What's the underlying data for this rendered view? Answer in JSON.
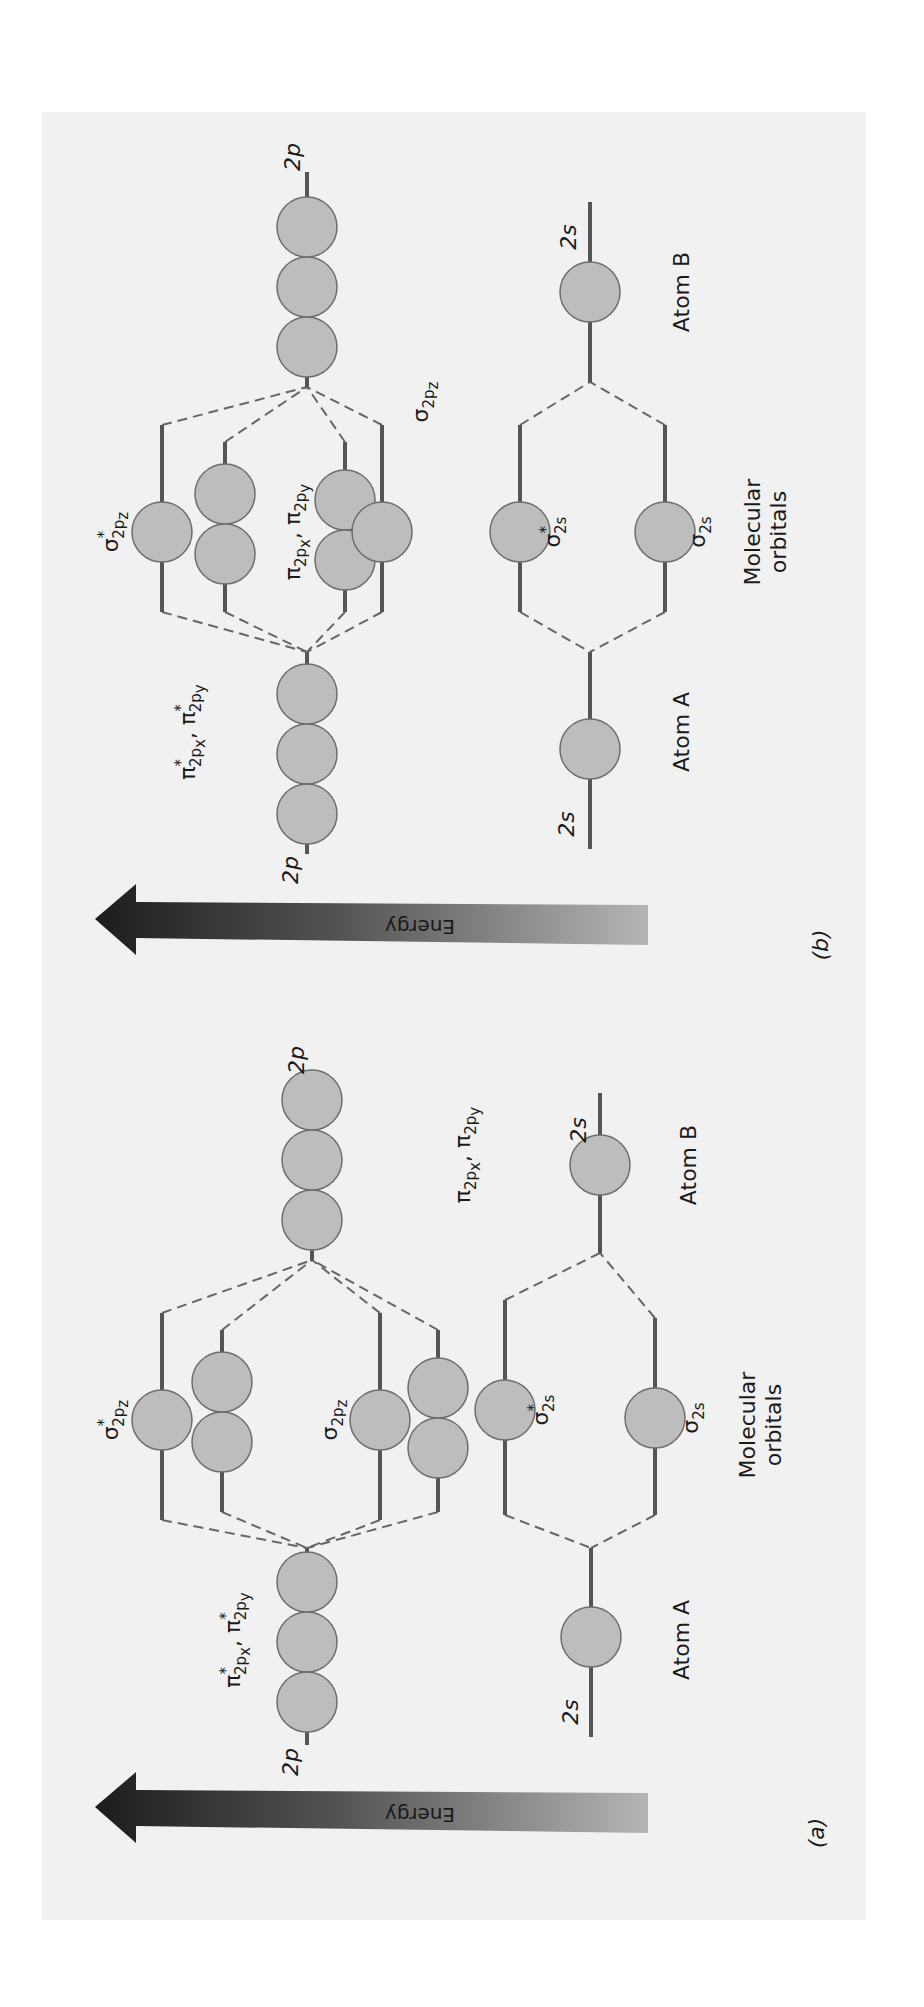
{
  "figure": {
    "background": "#f1f1f1",
    "orbital_fill": "#bdbdbd",
    "line_color": "#555555",
    "orientation": "rotated-90-ccw"
  },
  "panels": [
    {
      "id": "a",
      "caption": "(a)",
      "energy_label": "Energy",
      "atom_a_label": "Atom A",
      "atom_b_label": "Atom B",
      "mo_label_line1": "Molecular",
      "mo_label_line2": "orbitals",
      "ao_2p_label": "2p",
      "ao_2s_label": "2s",
      "mo_order_low_to_high": [
        "σ2s",
        "σ*2s",
        "π2px, π2py",
        "σ2pz",
        "π*2px, π*2py",
        "σ*2pz"
      ],
      "labels": {
        "sigma_star_2pz": {
          "base": "σ",
          "sup": "*",
          "sub": "2p",
          "subsub": "z"
        },
        "pi_star_2p": {
          "text1": "π",
          "sup1": "*",
          "sub1": "2p",
          "subsub1": "x",
          "sep": ", ",
          "text2": "π",
          "sup2": "*",
          "sub2": "2p",
          "subsub2": "y"
        },
        "sigma_2pz": {
          "base": "σ",
          "sub": "2p",
          "subsub": "z"
        },
        "pi_2p": {
          "text1": "π",
          "sub1": "2p",
          "subsub1": "x",
          "sep": ", ",
          "text2": "π",
          "sub2": "2p",
          "subsub2": "y"
        },
        "sigma_star_2s": {
          "base": "σ",
          "sup": "*",
          "sub": "2s"
        },
        "sigma_2s": {
          "base": "σ",
          "sub": "2s"
        }
      }
    },
    {
      "id": "b",
      "caption": "(b)",
      "energy_label": "Energy",
      "atom_a_label": "Atom A",
      "atom_b_label": "Atom B",
      "mo_label_line1": "Molecular",
      "mo_label_line2": "orbitals",
      "ao_2p_label": "2p",
      "ao_2s_label": "2s",
      "mo_order_low_to_high": [
        "σ2s",
        "σ*2s",
        "σ2pz",
        "π2px, π2py",
        "π*2px, π*2py",
        "σ*2pz"
      ],
      "labels": {
        "sigma_star_2pz": {
          "base": "σ",
          "sup": "*",
          "sub": "2p",
          "subsub": "z"
        },
        "pi_star_2p": {
          "text1": "π",
          "sup1": "*",
          "sub1": "2p",
          "subsub1": "x",
          "sep": ", ",
          "text2": "π",
          "sup2": "*",
          "sub2": "2p",
          "subsub2": "y"
        },
        "sigma_2pz": {
          "base": "σ",
          "sub": "2p",
          "subsub": "z"
        },
        "pi_2p": {
          "text1": "π",
          "sub1": "2p",
          "subsub1": "x",
          "sep": ", ",
          "text2": "π",
          "sub2": "2p",
          "subsub2": "y"
        },
        "sigma_star_2s": {
          "base": "σ",
          "sup": "*",
          "sub": "2s"
        },
        "sigma_2s": {
          "base": "σ",
          "sub": "2s"
        }
      }
    }
  ]
}
